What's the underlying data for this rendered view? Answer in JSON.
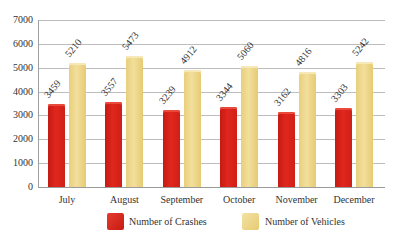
{
  "chart_data": {
    "type": "bar",
    "title": "",
    "xlabel": "",
    "ylabel": "",
    "ylim": [
      0,
      7000
    ],
    "yticks": [
      0,
      1000,
      2000,
      3000,
      4000,
      5000,
      6000,
      7000
    ],
    "grid": true,
    "legend_position": "bottom",
    "categories": [
      "July",
      "August",
      "September",
      "October",
      "November",
      "December"
    ],
    "series": [
      {
        "name": "Number of Crashes",
        "color": "#d8211a",
        "values": [
          3459,
          3557,
          3239,
          3344,
          3162,
          3303
        ]
      },
      {
        "name": "Number of Vehicles",
        "color": "#eed78c",
        "values": [
          5210,
          5473,
          4912,
          5060,
          4816,
          5242
        ]
      }
    ]
  }
}
